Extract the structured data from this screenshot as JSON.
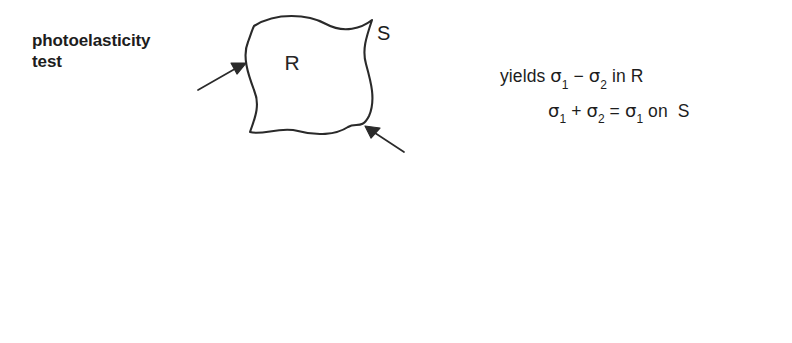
{
  "figure": {
    "background_color": "#ffffff",
    "ink_color": "#1d1d1d",
    "outline_color": "#2a2a2a"
  },
  "rows": [
    {
      "id": "photoelasticity",
      "caption": "photoelasticity\ntest",
      "diagram": {
        "region_label": "R",
        "boundary_label": "S",
        "arrow_count": 2
      },
      "equations": [
        {
          "prefix": "yields ",
          "sigma1": "σ",
          "sub1": "1",
          "op": " − ",
          "sigma2": "σ",
          "sub2": "2",
          "suffix": " in R",
          "plain": "yields σ1 − σ2 in R",
          "indent": false
        },
        {
          "prefix": "",
          "sigma1": "σ",
          "sub1": "1",
          "op": " + ",
          "sigma2": "σ",
          "sub2": "2",
          "suffix": " = σ1 on  S",
          "plain": "σ1 + σ2 = σ1 on  S",
          "indent": true
        }
      ]
    },
    {
      "id": "laplace",
      "caption": "Laplace\nsolution",
      "diagram": {
        "region_label": "R",
        "boundary_label": "S",
        "arrow_count": 2
      },
      "equations": [
        {
          "plain": "know ( σ1 + σ2 ) on  S",
          "indent": false
        },
        {
          "plain": "solve ∇²( σ1 + σ2) = 0",
          "indent": false
        },
        {
          "plain": "yields σ1  +  σ2 in R",
          "indent": false
        }
      ]
    }
  ]
}
